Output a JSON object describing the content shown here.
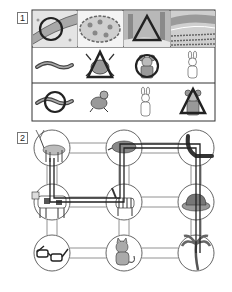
{
  "questions": [
    {
      "number": "1",
      "rows": [
        {
          "kind": "scenes",
          "items": [
            {
              "name": "river-bank",
              "mark": "circle"
            },
            {
              "name": "pond-with-lily-pads",
              "mark": "none"
            },
            {
              "name": "forest",
              "mark": "triangle"
            },
            {
              "name": "farm-field",
              "mark": "none"
            }
          ]
        },
        {
          "kind": "animals",
          "items": [
            {
              "name": "eel",
              "mark": "none"
            },
            {
              "name": "crab",
              "mark": "triangle"
            },
            {
              "name": "bear",
              "mark": "circle"
            },
            {
              "name": "rabbit",
              "mark": "none"
            }
          ]
        },
        {
          "kind": "animals",
          "items": [
            {
              "name": "eel",
              "mark": "circle"
            },
            {
              "name": "frog",
              "mark": "none"
            },
            {
              "name": "rabbit",
              "mark": "none"
            },
            {
              "name": "bear",
              "mark": "triangle"
            }
          ]
        }
      ]
    },
    {
      "number": "2",
      "grid": [
        [
          "deer",
          "boar",
          "seal"
        ],
        [
          "cow",
          "zebra",
          "hat"
        ],
        [
          "glasses",
          "cat",
          "palm-tree"
        ]
      ],
      "path": [
        "deer",
        "cow",
        "zebra",
        "boar",
        "seal",
        "hat",
        "palm-tree"
      ]
    }
  ],
  "colors": {
    "line": "#333333",
    "light_line": "#777777",
    "fill_grey": "#bdbdbd",
    "dark_mark": "#222222"
  }
}
